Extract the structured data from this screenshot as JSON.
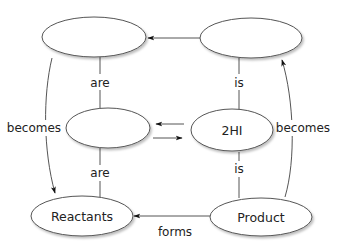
{
  "diagram": {
    "type": "concept-map",
    "nodes": {
      "top_left": {
        "label": ""
      },
      "top_right": {
        "label": ""
      },
      "middle_left": {
        "label": ""
      },
      "middle_right": {
        "label": "2HI"
      },
      "bottom_left": {
        "label": "Reactants"
      },
      "bottom_right": {
        "label": "Product"
      }
    },
    "edges": {
      "top_right_to_top_left": {
        "label": ""
      },
      "top_left_middle_left": {
        "label": "are"
      },
      "top_right_middle_right": {
        "label": "is"
      },
      "middle_left_bottom_left": {
        "label": "are"
      },
      "middle_right_bottom_right": {
        "label": "is"
      },
      "top_left_to_bottom_left": {
        "label": "becomes"
      },
      "bottom_right_to_top_right": {
        "label": "becomes"
      },
      "middle_right_to_middle_left": {
        "label": ""
      },
      "middle_left_to_middle_right": {
        "label": ""
      },
      "bottom_right_to_bottom_left": {
        "label": "forms"
      }
    },
    "colors": {
      "stroke": "#555555",
      "text": "#222222",
      "background": "#ffffff"
    }
  }
}
